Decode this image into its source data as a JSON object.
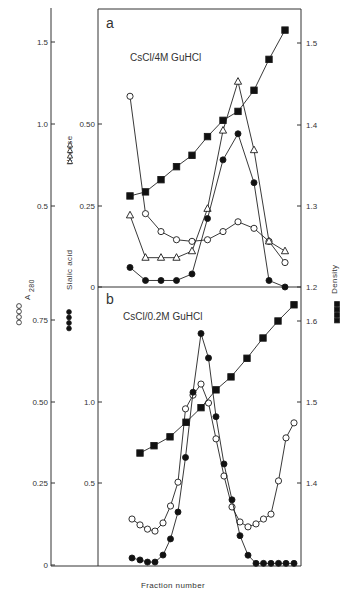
{
  "chart_data": [
    {
      "type": "line",
      "panel": "a",
      "title": "CsCl/4M GuHCl",
      "xlabel": "Fraction number",
      "x": [
        1,
        2,
        3,
        4,
        5,
        6,
        7,
        8,
        9,
        10,
        11
      ],
      "series": [
        {
          "name": "A280",
          "marker": "open-circle",
          "axis": "left-outer",
          "values": [
            1.17,
            0.45,
            0.34,
            0.29,
            0.28,
            0.29,
            0.34,
            0.4,
            0.36,
            0.28,
            0.15
          ]
        },
        {
          "name": "Hexose",
          "marker": "open-triangle",
          "axis": "left-inner",
          "values": [
            0.22,
            0.09,
            0.09,
            0.09,
            0.11,
            0.24,
            0.48,
            0.63,
            0.42,
            0.14,
            0.11
          ]
        },
        {
          "name": "Sialic acid",
          "marker": "filled-circle",
          "axis": "left-inner",
          "values": [
            0.06,
            0.02,
            0.02,
            0.02,
            0.04,
            0.21,
            0.39,
            0.47,
            0.32,
            0.02,
            0.0
          ]
        },
        {
          "name": "Density",
          "marker": "filled-square",
          "axis": "right",
          "values": [
            1.312,
            1.317,
            1.332,
            1.348,
            1.362,
            1.385,
            1.405,
            1.416,
            1.442,
            1.48,
            1.516
          ]
        }
      ],
      "axes": {
        "left_outer": {
          "label": "A280",
          "ticks": [
            "0",
            "0.5",
            "1.0",
            "1.5"
          ],
          "range": [
            0,
            1.75
          ]
        },
        "left_inner": {
          "label": "Hexose / Sialic acid",
          "ticks": [
            "0",
            "0.25",
            "0.50"
          ],
          "range": [
            0,
            0.85
          ]
        },
        "right": {
          "label": "Density",
          "ticks": [
            "1.2",
            "1.3",
            "1.4",
            "1.5"
          ],
          "range": [
            1.2,
            1.53
          ]
        }
      }
    },
    {
      "type": "line",
      "panel": "b",
      "title": "CsCl/0.2M GuHCl",
      "xlabel": "Fraction number",
      "x": [
        1,
        2,
        3,
        4,
        5,
        6,
        7,
        8,
        9,
        10,
        11,
        12,
        13,
        14,
        15,
        16,
        17,
        18,
        19,
        20,
        21,
        22
      ],
      "series": [
        {
          "name": "A280",
          "marker": "open-circle",
          "axis": "left-outer",
          "values": [
            0.141,
            0.123,
            0.11,
            0.104,
            0.129,
            0.181,
            0.254,
            0.479,
            0.521,
            0.555,
            0.497,
            0.387,
            0.273,
            0.178,
            0.132,
            0.117,
            0.126,
            0.141,
            0.156,
            0.258,
            0.39,
            0.436
          ]
        },
        {
          "name": "Sialic acid",
          "marker": "filled-circle",
          "axis": "left-inner",
          "values": [
            0.043,
            0.031,
            0.018,
            0.018,
            0.061,
            0.16,
            0.325,
            0.66,
            1.06,
            1.42,
            1.27,
            0.91,
            0.62,
            0.4,
            0.18,
            0.06,
            0.01,
            0.01,
            0.01,
            0.01,
            0.01,
            0.01
          ]
        },
        {
          "name": "Density",
          "marker": "filled-square",
          "axis": "right",
          "x_index": [
            2,
            4,
            6,
            8,
            10,
            12,
            14,
            16,
            18,
            20,
            22
          ],
          "values": [
            1.437,
            1.446,
            1.457,
            1.475,
            1.493,
            1.515,
            1.531,
            1.554,
            1.579,
            1.6,
            1.62
          ]
        }
      ],
      "axes": {
        "left_outer": {
          "label": "A280",
          "ticks": [
            "0",
            "0.25",
            "0.50",
            "0.75"
          ],
          "range": [
            0,
            0.85
          ]
        },
        "left_inner": {
          "label": "Sialic acid",
          "ticks": [
            "0.5",
            "1.0"
          ],
          "range": [
            0,
            1.7
          ]
        },
        "right": {
          "label": "Density",
          "ticks": [
            "1.4",
            "1.5",
            "1.6"
          ],
          "range": [
            1.3,
            1.66
          ]
        }
      }
    }
  ],
  "labels": {
    "panel_a": "a",
    "panel_b": "b",
    "title_a": "CsCl/4M GuHCl",
    "title_b": "CsCl/0.2M GuHCl",
    "xlabel": "Fraction number",
    "a280": "A",
    "a280_sub": "280",
    "hexose": "Hexose",
    "sialic": "Sialic acid",
    "density": "Density"
  },
  "ticks": {
    "outer_a": [
      {
        "t": "1.5",
        "y": 42
      },
      {
        "t": "1.0",
        "y": 124
      },
      {
        "t": "0.5",
        "y": 206
      }
    ],
    "inner_a": [
      {
        "t": "0.50",
        "y": 124
      },
      {
        "t": "0.25",
        "y": 206
      },
      {
        "t": "0",
        "y": 287
      }
    ],
    "right_a": [
      {
        "t": "1.5",
        "y": 43
      },
      {
        "t": "1.4",
        "y": 125
      },
      {
        "t": "1.3",
        "y": 206
      },
      {
        "t": "1.2",
        "y": 287
      }
    ],
    "outer_b": [
      {
        "t": "0.75",
        "y": 320
      },
      {
        "t": "0.50",
        "y": 402
      },
      {
        "t": "0.25",
        "y": 483
      },
      {
        "t": "0",
        "y": 565
      }
    ],
    "inner_b": [
      {
        "t": "1.0",
        "y": 402
      },
      {
        "t": "0.5",
        "y": 483
      }
    ],
    "right_b": [
      {
        "t": "1.6",
        "y": 321
      },
      {
        "t": "1.5",
        "y": 402
      },
      {
        "t": "1.4",
        "y": 483
      }
    ]
  },
  "plot": {
    "xa": [
      130,
      145.5,
      161,
      176.5,
      192,
      207.5,
      223,
      238,
      254,
      269,
      285
    ],
    "xb": [
      132,
      140,
      147.5,
      155,
      163,
      170.5,
      178,
      185.5,
      193,
      201,
      208.5,
      216,
      224,
      232,
      240,
      248,
      256,
      263.5,
      271,
      278.5,
      286,
      294
    ],
    "xb_density": [
      140,
      154,
      170,
      186,
      201,
      216,
      231,
      247,
      263,
      278,
      294
    ]
  }
}
